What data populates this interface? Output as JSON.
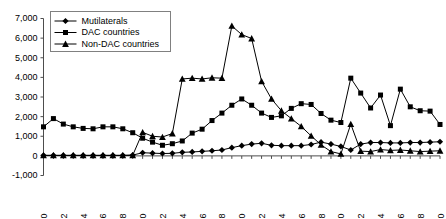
{
  "chart_data": {
    "type": "line",
    "title": "",
    "subtitle": "",
    "xlabel": "",
    "ylabel": "",
    "xlim": [
      1960,
      2000
    ],
    "ylim": [
      -1000,
      7000
    ],
    "grid": false,
    "legend_position": "top-left",
    "x": [
      1960,
      1961,
      1962,
      1963,
      1964,
      1965,
      1966,
      1967,
      1968,
      1969,
      1970,
      1971,
      1972,
      1973,
      1974,
      1975,
      1976,
      1977,
      1978,
      1979,
      1980,
      1981,
      1982,
      1983,
      1984,
      1985,
      1986,
      1987,
      1988,
      1989,
      1990,
      1991,
      1992,
      1993,
      1994,
      1995,
      1996,
      1997,
      1998,
      1999,
      2000
    ],
    "ytick_labels": [
      "7,000",
      "6,000",
      "5,000",
      "4,000",
      "3,000",
      "2,000",
      "1,000",
      "0",
      "-1,000"
    ],
    "ytick_values": [
      7000,
      6000,
      5000,
      4000,
      3000,
      2000,
      1000,
      0,
      -1000
    ],
    "xtick_labels": [
      "1960",
      "1962",
      "1964",
      "1966",
      "1968",
      "1970",
      "1972",
      "1974",
      "1976",
      "1978",
      "1980",
      "1982",
      "1984",
      "1986",
      "1988",
      "1990",
      "1992",
      "1994",
      "1996",
      "1998",
      "2000"
    ],
    "xtick_values": [
      1960,
      1962,
      1964,
      1966,
      1968,
      1970,
      1972,
      1974,
      1976,
      1978,
      1980,
      1982,
      1984,
      1986,
      1988,
      1990,
      1992,
      1994,
      1996,
      1998,
      2000
    ],
    "series": [
      {
        "name": "Mutilaterals",
        "marker": "diamond",
        "values": [
          30,
          30,
          30,
          30,
          30,
          30,
          30,
          30,
          30,
          40,
          160,
          140,
          120,
          130,
          180,
          200,
          230,
          260,
          300,
          420,
          520,
          600,
          640,
          540,
          520,
          520,
          520,
          580,
          700,
          600,
          480,
          300,
          600,
          680,
          680,
          660,
          660,
          680,
          680,
          700,
          720
        ]
      },
      {
        "name": "DAC countries",
        "marker": "square",
        "values": [
          1480,
          1900,
          1620,
          1480,
          1400,
          1380,
          1480,
          1480,
          1380,
          1180,
          900,
          700,
          540,
          620,
          760,
          1160,
          1360,
          1800,
          2180,
          2580,
          2900,
          2580,
          2180,
          1960,
          2040,
          2420,
          2660,
          2620,
          2160,
          1820,
          1700,
          3960,
          3200,
          2440,
          3100,
          1540,
          3400,
          2500,
          2300,
          2280,
          1600
        ]
      },
      {
        "name": "Non-DAC countries",
        "marker": "triangle",
        "values": [
          20,
          20,
          20,
          20,
          20,
          20,
          20,
          20,
          20,
          30,
          1200,
          1000,
          960,
          1140,
          3920,
          3960,
          3920,
          3980,
          3960,
          6620,
          6180,
          5980,
          3800,
          2900,
          2300,
          1900,
          1500,
          1020,
          560,
          220,
          100,
          1620,
          240,
          220,
          320,
          280,
          300,
          260,
          220,
          240,
          260
        ]
      }
    ]
  },
  "legend": {
    "items": [
      {
        "label": "Mutilaterals"
      },
      {
        "label": "DAC countries"
      },
      {
        "label": "Non-DAC countries"
      }
    ]
  }
}
